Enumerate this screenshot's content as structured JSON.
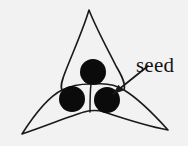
{
  "figure": {
    "kind": "line-diagram",
    "background_color": "#f2f2f2",
    "ink_color": "#1a1a1a",
    "seed_fill_color": "#0b0b0b",
    "label": {
      "text": "seed",
      "x": 136,
      "y": 72,
      "font_size": 21
    },
    "leader": {
      "from_x": 148,
      "from_y": 66,
      "to_x": 113,
      "to_y": 94,
      "has_arrowhead": true
    },
    "pod": {
      "lobe_count": 3,
      "tips": [
        {
          "name": "top-tip",
          "x": 89,
          "y": 10
        },
        {
          "name": "bottom-left-tip",
          "x": 22,
          "y": 134
        },
        {
          "name": "bottom-right-tip",
          "x": 168,
          "y": 130
        }
      ],
      "outline_path": "M 89 10 C 83 30 73 52 66 70 C 62 80 60 86 62 90 C 50 96 36 112 22 134 C 46 126 70 116 84 112 C 92 110 98 110 104 112 C 122 118 146 126 168 130 C 150 110 134 96 124 90 C 126 84 122 76 116 66 C 108 50 96 28 89 10 Z",
      "septa": [
        {
          "name": "septum-upper-left",
          "path": "M 62 90 C 70 86 80 84 90 84"
        },
        {
          "name": "septum-upper-right",
          "path": "M 124 90 C 116 85 106 83 95 84"
        },
        {
          "name": "septum-vertical",
          "path": "M 91 84 C 90 92 90 102 90 112"
        }
      ]
    },
    "seeds": [
      {
        "name": "seed-top",
        "cx": 93,
        "cy": 72,
        "r": 13
      },
      {
        "name": "seed-left",
        "cx": 72,
        "cy": 99,
        "r": 13
      },
      {
        "name": "seed-right",
        "cx": 107,
        "cy": 100,
        "r": 13
      }
    ]
  }
}
